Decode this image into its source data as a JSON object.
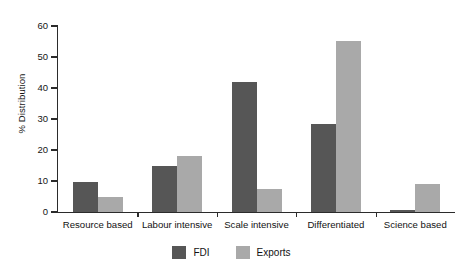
{
  "chart_data": {
    "type": "bar",
    "title": "",
    "xlabel": "",
    "ylabel": "% Distribution",
    "ylim": [
      0,
      60
    ],
    "yticks": [
      0,
      10,
      20,
      30,
      40,
      50,
      60
    ],
    "ytick_labels": [
      "0",
      "10",
      "20",
      "30",
      "40",
      "50",
      "60"
    ],
    "grid": false,
    "legend_position": "bottom-center",
    "categories": [
      "Resource based",
      "Labour intensive",
      "Scale intensive",
      "Differentiated",
      "Science based"
    ],
    "series": [
      {
        "name": "FDI",
        "color": "#565656",
        "values": [
          9.8,
          14.7,
          42.0,
          28.5,
          0.6
        ]
      },
      {
        "name": "Exports",
        "color": "#a9a9a9",
        "values": [
          4.7,
          18.0,
          7.5,
          55.3,
          9.0
        ]
      }
    ]
  },
  "legend": {
    "items": [
      {
        "label": "FDI",
        "swatch": "legend-swatch-fdi"
      },
      {
        "label": "Exports",
        "swatch": "legend-swatch-exports"
      }
    ]
  }
}
